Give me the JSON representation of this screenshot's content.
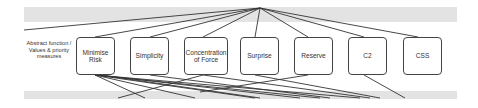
{
  "diagram": {
    "level_label": "Abstract function / Values & priority measures",
    "nodes": [
      {
        "label": "Minimise Risk",
        "x": 76,
        "w": 39
      },
      {
        "label": "Simplicity",
        "x": 130,
        "w": 39
      },
      {
        "label": "Concentration of Force",
        "x": 184,
        "w": 44
      },
      {
        "label": "Surprise",
        "x": 240,
        "w": 39
      },
      {
        "label": "Reserve",
        "x": 294,
        "w": 39
      },
      {
        "label": "C2",
        "x": 348,
        "w": 39
      },
      {
        "label": "CSS",
        "x": 403,
        "w": 39
      }
    ],
    "colors": {
      "band": "#e3e3e3",
      "line": "#333333",
      "border": "#444444"
    }
  }
}
